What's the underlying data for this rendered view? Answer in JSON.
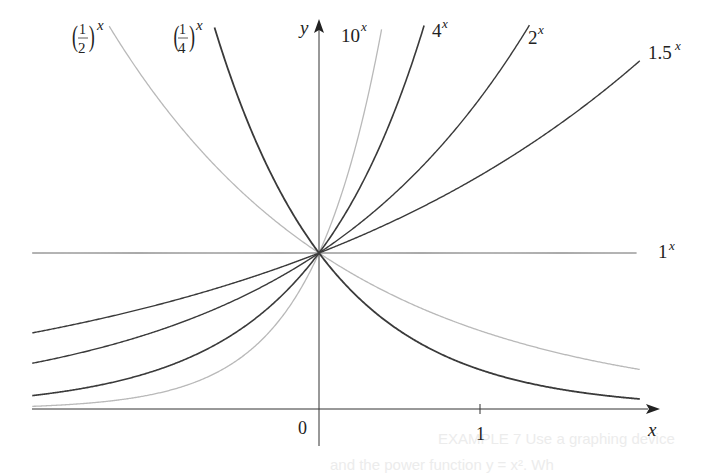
{
  "chart_data": {
    "type": "line",
    "title": "",
    "xlabel": "x",
    "ylabel": "y",
    "xlim": [
      -1.77,
      1.98
    ],
    "ylim": [
      0,
      2.46
    ],
    "x_ticks": [
      {
        "value": 0,
        "label": "0"
      },
      {
        "value": 1,
        "label": "1"
      }
    ],
    "grid": false,
    "legend": "inline labels at curve ends",
    "series": [
      {
        "name": "(1/2)^x",
        "base": 0.5,
        "color": "#b9b9b9",
        "width": 1.3,
        "label": "(1/2)^x"
      },
      {
        "name": "(1/4)^x",
        "base": 0.25,
        "color": "#3a3a3a",
        "width": 1.8,
        "label": "(1/4)^x"
      },
      {
        "name": "10^x",
        "base": 10,
        "color": "#b9b9b9",
        "width": 1.3,
        "label": "10^x"
      },
      {
        "name": "4^x",
        "base": 4,
        "color": "#3a3a3a",
        "width": 1.6,
        "label": "4^x"
      },
      {
        "name": "2^x",
        "base": 2,
        "color": "#3a3a3a",
        "width": 1.4,
        "label": "2^x"
      },
      {
        "name": "1.5^x",
        "base": 1.5,
        "color": "#3a3a3a",
        "width": 1.4,
        "label": "1.5^x"
      },
      {
        "name": "1^x",
        "base": 1,
        "color": "#555555",
        "width": 1.0,
        "label": "1^x"
      }
    ],
    "common_point": {
      "x": 0,
      "y": 1
    }
  },
  "labels": {
    "half": {
      "num": "1",
      "den": "2",
      "exp": "x"
    },
    "quarter": {
      "num": "1",
      "den": "4",
      "exp": "x"
    },
    "ten": {
      "base": "10",
      "exp": "x"
    },
    "four": {
      "base": "4",
      "exp": "x"
    },
    "two": {
      "base": "2",
      "exp": "x"
    },
    "onefive": {
      "base": "1.5",
      "exp": "x"
    },
    "one": {
      "base": "1",
      "exp": "x"
    },
    "y_axis": "y",
    "x_axis": "x",
    "origin": "0",
    "tick_one": "1"
  },
  "bleed_through_text": {
    "line1": "EXAMPLE 7  Use a graphing device",
    "line2": "and the power function y = x². Wh"
  }
}
